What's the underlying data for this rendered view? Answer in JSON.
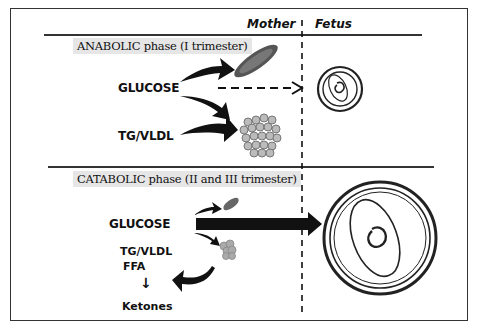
{
  "header": {
    "mother_label": "Mother",
    "fetus_label": "Fetus"
  },
  "anabolic": {
    "phase_title": "ANABOLIC phase (I trimester)",
    "glucose_label": "GLUCOSE",
    "tg_label": "TG/VLDL"
  },
  "catabolic": {
    "phase_title": "CATABOLIC phase (II and III trimester)",
    "glucose_label": "GLUCOSE",
    "tg_label": "TG/VLDL",
    "ffa_label": "FFA",
    "arrow_glyph": "↓",
    "ketones_label": "Ketones"
  }
}
